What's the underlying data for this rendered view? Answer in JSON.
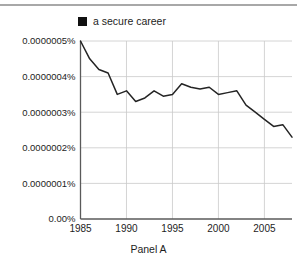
{
  "figure": {
    "title": "Panel A",
    "legend": {
      "swatch_color": "#111111",
      "label": "a secure career"
    },
    "line_color": "#242424",
    "grid_color": "#c9c9c9",
    "axis_color": "#5a5a5a"
  },
  "chart_data": {
    "type": "line",
    "title": "",
    "subtitle": "",
    "xlabel": "Panel A",
    "ylabel": "",
    "grid": true,
    "legend_position": "top",
    "xlim": [
      1985,
      2008
    ],
    "ylim": [
      0,
      5e-07
    ],
    "xticks": [
      1985,
      1990,
      1995,
      2000,
      2005
    ],
    "xticklabels": [
      "1985",
      "1990",
      "1995",
      "2000",
      "2005"
    ],
    "yticks": [
      0,
      1e-07,
      2e-07,
      3e-07,
      4e-07,
      5e-07
    ],
    "yticklabels": [
      "0.00%",
      "0.0000001%",
      "0.0000002%",
      "0.0000003%",
      "0.0000004%",
      "0.0000005%"
    ],
    "series": [
      {
        "name": "a secure career",
        "x": [
          1985,
          1986,
          1987,
          1988,
          1989,
          1990,
          1991,
          1992,
          1993,
          1994,
          1995,
          1996,
          1997,
          1998,
          1999,
          2000,
          2001,
          2002,
          2003,
          2004,
          2005,
          2006,
          2007,
          2008
        ],
        "values": [
          5e-07,
          4.5e-07,
          4.2e-07,
          4.1e-07,
          3.5e-07,
          3.6e-07,
          3.3e-07,
          3.4e-07,
          3.6e-07,
          3.45e-07,
          3.5e-07,
          3.8e-07,
          3.7e-07,
          3.65e-07,
          3.7e-07,
          3.5e-07,
          3.55e-07,
          3.6e-07,
          3.2e-07,
          3e-07,
          2.8e-07,
          2.6e-07,
          2.65e-07,
          2.3e-07
        ]
      }
    ]
  }
}
